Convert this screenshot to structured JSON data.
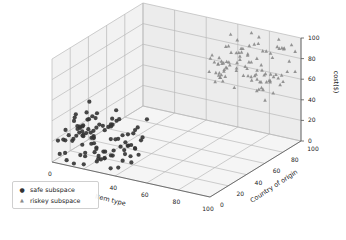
{
  "chart_data": {
    "type": "scatter",
    "projection": "3d",
    "title": "",
    "xlabel": "Item type",
    "ylabel": "Country of origin",
    "zlabel": "cost($)",
    "xlim": [
      0,
      100
    ],
    "ylim": [
      0,
      100
    ],
    "zlim": [
      0,
      100
    ],
    "x_ticks": [
      "0",
      "20",
      "40",
      "60",
      "80",
      "100"
    ],
    "x_ticks_visible": [
      "0",
      "40",
      "60",
      "80",
      "100"
    ],
    "y_ticks": [
      "0",
      "20",
      "40",
      "60",
      "80",
      "100"
    ],
    "z_ticks": [
      "0",
      "20",
      "40",
      "60",
      "80",
      "100"
    ],
    "grid": true,
    "legend_position": "lower left",
    "series": [
      {
        "name": "safe subspace",
        "marker": "circle",
        "color": "#333333",
        "x_range": [
          0,
          40
        ],
        "y_range": [
          0,
          40
        ],
        "z_range": [
          0,
          40
        ],
        "approx_count": 100
      },
      {
        "name": "riskey subspace",
        "marker": "triangle",
        "color": "#8a8a8a",
        "x_range": [
          60,
          100
        ],
        "y_range": [
          60,
          100
        ],
        "z_range": [
          60,
          100
        ],
        "approx_count": 100
      }
    ]
  },
  "legend": {
    "items": [
      {
        "label": "safe subspace",
        "symbol": "●"
      },
      {
        "label": "riskey subspace",
        "symbol": "▲"
      }
    ]
  },
  "axes": {
    "x_label": "Item type",
    "y_label": "Country of origin",
    "z_label": "cost($)"
  }
}
